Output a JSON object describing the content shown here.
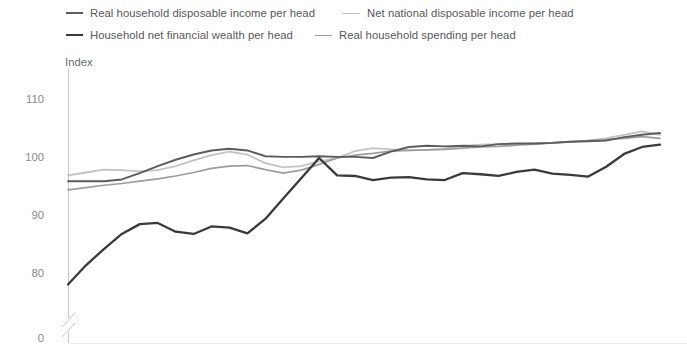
{
  "chart_data": {
    "type": "line",
    "title": "",
    "subtitle": "",
    "xlabel": "",
    "ylabel": "Index",
    "ylim": [
      74,
      114
    ],
    "yticks": [
      110,
      100,
      90,
      80,
      0
    ],
    "axis_break": true,
    "grid": false,
    "legend_position": "top",
    "x": [
      1,
      2,
      3,
      4,
      5,
      6,
      7,
      8,
      9,
      10,
      11,
      12,
      13,
      14,
      15,
      16,
      17,
      18,
      19,
      20,
      21,
      22,
      23,
      24,
      25,
      26,
      27,
      28,
      29,
      30,
      31,
      32,
      33,
      34
    ],
    "series": [
      {
        "name": "Real household disposable income per head",
        "color": "#5c5c5e",
        "width": 1.9,
        "values": [
          96.0,
          96.0,
          96.0,
          96.3,
          97.4,
          98.6,
          99.7,
          100.6,
          101.3,
          101.6,
          101.3,
          100.3,
          100.2,
          100.2,
          100.3,
          100.2,
          100.2,
          100.0,
          101.1,
          101.9,
          102.1,
          102.0,
          102.1,
          102.0,
          102.4,
          102.5,
          102.5,
          102.6,
          102.8,
          102.9,
          103.0,
          103.6,
          104.0,
          104.3
        ]
      },
      {
        "name": "Net national disposable income per head",
        "color": "#c3c3c5",
        "width": 1.8,
        "values": [
          97.0,
          97.5,
          98.0,
          97.9,
          97.7,
          97.9,
          98.6,
          99.6,
          100.5,
          101.1,
          100.6,
          99.1,
          98.4,
          98.6,
          99.4,
          100.0,
          101.2,
          101.7,
          101.5,
          101.3,
          101.4,
          101.6,
          102.1,
          102.3,
          102.4,
          102.4,
          102.5,
          102.6,
          102.8,
          103.0,
          103.4,
          104.0,
          104.6,
          104.0
        ]
      },
      {
        "name": "Household net financial wealth per head",
        "color": "#3a3a3c",
        "width": 2.3,
        "values": [
          78.2,
          81.5,
          84.3,
          86.9,
          88.6,
          88.8,
          87.3,
          86.9,
          88.2,
          88.0,
          87.0,
          89.5,
          93.0,
          96.5,
          100.0,
          97.0,
          96.9,
          96.2,
          96.6,
          96.7,
          96.3,
          96.2,
          97.4,
          97.2,
          96.9,
          97.6,
          98.0,
          97.3,
          97.1,
          96.8,
          98.5,
          100.7,
          101.9,
          102.3
        ]
      },
      {
        "name": "Real household spending per head",
        "color": "#9d9d9f",
        "width": 1.7,
        "values": [
          94.5,
          94.9,
          95.3,
          95.6,
          96.0,
          96.4,
          96.9,
          97.5,
          98.2,
          98.6,
          98.7,
          98.0,
          97.4,
          97.9,
          98.9,
          100.0,
          100.5,
          100.8,
          101.2,
          101.3,
          101.4,
          101.5,
          101.7,
          101.9,
          102.0,
          102.2,
          102.4,
          102.6,
          102.8,
          103.0,
          103.2,
          103.4,
          103.7,
          103.4
        ]
      }
    ]
  },
  "legend": {
    "rows": [
      [
        {
          "label": "Real household disposable income per head",
          "color": "#5c5c5e",
          "thickness": 2.2,
          "gap": 28
        },
        {
          "label": "Net national disposable income per head",
          "color": "#c3c3c5",
          "thickness": 1.6,
          "gap": 0
        }
      ],
      [
        {
          "label": "Household net financial wealth per head",
          "color": "#3a3a3c",
          "thickness": 2.6,
          "gap": 22
        },
        {
          "label": "Real household spending per head",
          "color": "#9d9d9f",
          "thickness": 1.6,
          "gap": 0
        }
      ]
    ]
  },
  "axis": {
    "y_title": "Index",
    "ticks": [
      "110",
      "100",
      "90",
      "80",
      "0"
    ],
    "axis_color": "#c8c8ca",
    "tick_color": "#8a8a8c"
  }
}
